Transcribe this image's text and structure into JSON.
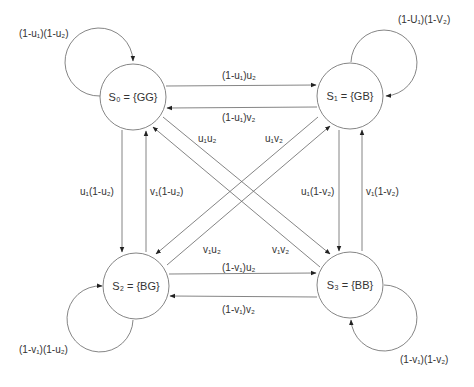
{
  "diagram": {
    "type": "markov-chain-state-transition",
    "states": [
      {
        "id": "S0",
        "label": "S₀ = {GG}",
        "cx": 133,
        "cy": 97,
        "r": 33
      },
      {
        "id": "S1",
        "label": "S₁ = {GB}",
        "cx": 350,
        "cy": 96,
        "r": 33
      },
      {
        "id": "S2",
        "label": "S₂ = {BG}",
        "cx": 136,
        "cy": 286,
        "r": 33
      },
      {
        "id": "S3",
        "label": "S₃ = {BB}",
        "cx": 350,
        "cy": 285,
        "r": 33
      }
    ],
    "transitions": {
      "s0_self": "(1-u₁)(1-u₂)",
      "s1_self": "(1-U₁)(1-V₂)",
      "s2_self": "(1-v₁)(1-u₂)",
      "s3_self": "(1-v₁)(1-v₂)",
      "s0_to_s1": "(1-u₁)u₂",
      "s1_to_s0": "(1-u₁)v₂",
      "s0_to_s3": "u₁u₂",
      "s1_to_s2": "u₁v₂",
      "s0_to_s2": "u₁(1-u₂)",
      "s2_to_s0": "v₁(1-u₂)",
      "s1_to_s3": "u₁(1-v₂)",
      "s3_to_s1": "v₁(1-v₂)",
      "s2_to_s1": "v₁u₂",
      "s3_to_s0": "v₁v₂",
      "s2_to_s3": "(1-v₁)u₂",
      "s3_to_s2": "(1-v₁)v₂"
    },
    "line_color": "#555555",
    "text_color": "#333333"
  }
}
